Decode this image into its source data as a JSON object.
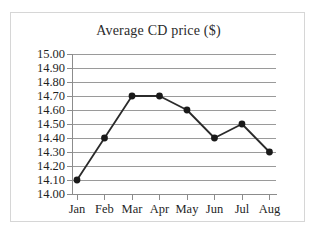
{
  "chart_data": {
    "type": "line",
    "title": "Average CD price ($)",
    "xlabel": "",
    "ylabel": "",
    "categories": [
      "Jan",
      "Feb",
      "Mar",
      "Apr",
      "May",
      "Jun",
      "Jul",
      "Aug"
    ],
    "values": [
      14.1,
      14.4,
      14.7,
      14.7,
      14.6,
      14.4,
      14.5,
      14.3
    ],
    "series": [
      {
        "name": "Average CD price",
        "values": [
          14.1,
          14.4,
          14.7,
          14.7,
          14.6,
          14.4,
          14.5,
          14.3
        ]
      }
    ],
    "ylim": [
      14.0,
      15.0
    ],
    "ytick_step": 0.1,
    "ytick_labels": [
      "15.00",
      "14.90",
      "14.80",
      "14.70",
      "14.60",
      "14.50",
      "14.40",
      "14.30",
      "14.20",
      "14.10",
      "14.00"
    ],
    "ytick_values": [
      15.0,
      14.9,
      14.8,
      14.7,
      14.6,
      14.5,
      14.4,
      14.3,
      14.2,
      14.1,
      14.0
    ],
    "grid": true,
    "legend": false,
    "legend_position": "none",
    "marker": "circle",
    "line_color": "#2b2b2b",
    "marker_color": "#1a1a1a",
    "grid_color": "#9a9a9a",
    "frame_color": "#d6d6d6",
    "background_color": "#ffffff"
  }
}
